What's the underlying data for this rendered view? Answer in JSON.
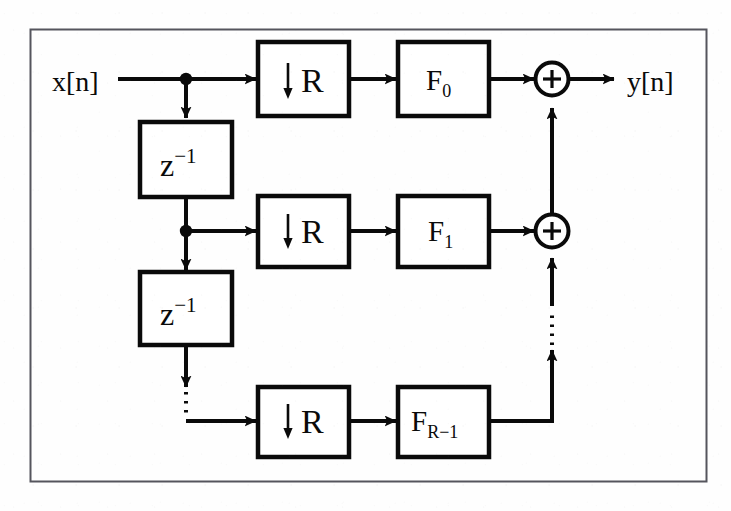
{
  "figure": {
    "background_color": "#fefefe",
    "ink_color": "#000000",
    "border_color": "#4a4a52"
  },
  "signals": {
    "input_label": "x[n]",
    "output_label": "y[n]"
  },
  "delays": [
    {
      "label_base": "z",
      "label_exponent": "−1",
      "name": "unit-delay-1"
    },
    {
      "label_base": "z",
      "label_exponent": "−1",
      "name": "unit-delay-2"
    }
  ],
  "branches": [
    {
      "index": 0,
      "downsampler_label": "R",
      "downsampler_arrow": "↓",
      "filter_label_base": "F",
      "filter_label_sub": "0"
    },
    {
      "index": 1,
      "downsampler_label": "R",
      "downsampler_arrow": "↓",
      "filter_label_base": "F",
      "filter_label_sub": "1"
    },
    {
      "index": 2,
      "downsampler_label": "R",
      "downsampler_arrow": "↓",
      "filter_label_base": "F",
      "filter_label_sub": "R−1"
    }
  ],
  "adders": [
    {
      "symbol": "+",
      "name": "summing-junction-top"
    },
    {
      "symbol": "+",
      "name": "summing-junction-middle"
    }
  ],
  "ellipses": {
    "vertical_delay_chain": "⋮",
    "vertical_adder_chain": "⋮"
  },
  "geometry": {
    "outer_border": {
      "x": 30,
      "y": 29,
      "w": 677,
      "h": 453
    },
    "rows_y": [
      79,
      231,
      421
    ],
    "column_x": {
      "tap": 186,
      "down": 258,
      "filt": 398,
      "sum": 552
    }
  }
}
